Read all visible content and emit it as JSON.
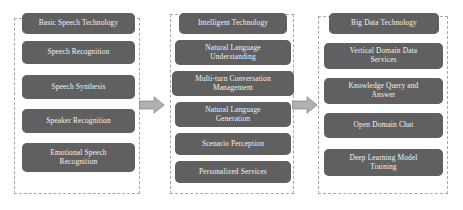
{
  "diagram": {
    "type": "three-stage-flow",
    "colors": {
      "node_fill": "#606060",
      "node_text": "#f2f2f2",
      "group_border": "#a8a8a8",
      "arrow_fill": "#b0b0b0",
      "arrow_stroke": "#8c8c8c",
      "background": "#ffffff"
    },
    "columns": [
      {
        "id": "basic-speech-technology",
        "header": "Basic Speech Technology",
        "nodes": [
          {
            "label": "Basic Speech Technology"
          },
          {
            "label": "Speech Recognition"
          },
          {
            "label": "Speech Synthesis"
          },
          {
            "label": "Speaker Recognition"
          },
          {
            "label": "Emotional  Speech\nRecognition"
          }
        ]
      },
      {
        "id": "intelligent-technology",
        "header": "Intelligent  Technology",
        "nodes": [
          {
            "label": "Intelligent  Technology"
          },
          {
            "label": "Natural Language\nUnderstanding"
          },
          {
            "label": "Multi-turn  Conversation\nManagement"
          },
          {
            "label": "Natural Language\nGeneration"
          },
          {
            "label": "Scenario Perception"
          },
          {
            "label": "Personalized  Services"
          }
        ]
      },
      {
        "id": "big-data-technology",
        "header": "Big Data Technology",
        "nodes": [
          {
            "label": "Big Data Technology"
          },
          {
            "label": "Vertical Domain Data\nServices"
          },
          {
            "label": "Knowledge Query and\nAnswer"
          },
          {
            "label": "Open Domain Chat"
          },
          {
            "label": "Deep Learning Model\nTraining"
          }
        ]
      }
    ],
    "arrows": [
      {
        "id": "arrow-stage-1-to-2",
        "direction": "right",
        "from": "basic-speech-technology",
        "to": "intelligent-technology"
      },
      {
        "id": "arrow-stage-2-to-3",
        "direction": "right",
        "from": "intelligent-technology",
        "to": "big-data-technology"
      }
    ]
  }
}
